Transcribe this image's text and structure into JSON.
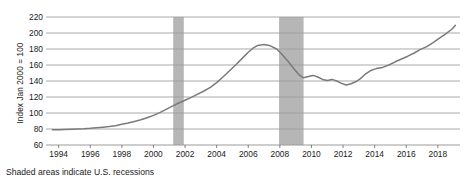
{
  "chart_data": {
    "type": "line",
    "title": "",
    "subtitle": "",
    "xlabel": "",
    "ylabel": "Index Jan 2000 = 100",
    "xlim": [
      1993.2,
      2019.4
    ],
    "ylim": [
      60,
      220
    ],
    "grid": true,
    "legend": null,
    "y_ticks": [
      60,
      80,
      100,
      120,
      140,
      160,
      180,
      200,
      220
    ],
    "x_ticks": [
      1994,
      1996,
      1998,
      2000,
      2002,
      2004,
      2006,
      2008,
      2010,
      2012,
      2014,
      2016,
      2018
    ],
    "colors": {
      "line": "#7a7a7a",
      "grid": "#9b9b9b",
      "recession_band": "#b6b6b6",
      "text": "#1a1a1a",
      "background": "#ffffff"
    },
    "annotations": [
      {
        "name": "recession-note",
        "text": "Shaded areas indicate U.S. recessions"
      }
    ],
    "shaded_regions": [
      {
        "name": "recession-2001",
        "x_start": 2001.25,
        "x_end": 2001.92
      },
      {
        "name": "recession-2008",
        "x_start": 2007.95,
        "x_end": 2009.5
      }
    ],
    "series": [
      {
        "name": "Home price index",
        "x": [
          1993.6,
          1994.0,
          1994.4,
          1994.8,
          1995.2,
          1995.6,
          1996.0,
          1996.4,
          1996.8,
          1997.2,
          1997.6,
          1998.0,
          1998.4,
          1998.8,
          1999.2,
          1999.6,
          2000.0,
          2000.4,
          2000.8,
          2001.2,
          2001.6,
          2002.0,
          2002.4,
          2002.8,
          2003.2,
          2003.6,
          2004.0,
          2004.4,
          2004.8,
          2005.2,
          2005.6,
          2006.0,
          2006.3,
          2006.6,
          2007.0,
          2007.4,
          2007.8,
          2008.1,
          2008.5,
          2008.9,
          2009.2,
          2009.5,
          2009.8,
          2010.1,
          2010.4,
          2010.7,
          2011.0,
          2011.3,
          2011.6,
          2011.9,
          2012.2,
          2012.5,
          2012.8,
          2013.1,
          2013.4,
          2013.8,
          2014.1,
          2014.5,
          2014.9,
          2015.3,
          2015.7,
          2016.1,
          2016.5,
          2016.9,
          2017.3,
          2017.7,
          2018.1,
          2018.5,
          2018.9,
          2019.1
        ],
        "y": [
          79.0,
          79.2,
          79.5,
          79.8,
          80.0,
          80.3,
          80.8,
          81.5,
          82.3,
          83.0,
          84.2,
          85.8,
          87.5,
          89.5,
          91.5,
          94.0,
          97.0,
          100.5,
          104.5,
          108.5,
          112.5,
          116.0,
          119.5,
          123.5,
          127.5,
          132.0,
          138.0,
          145.0,
          152.5,
          160.0,
          168.0,
          176.0,
          181.0,
          184.5,
          185.5,
          184.0,
          180.0,
          174.0,
          165.0,
          155.0,
          148.0,
          144.0,
          145.5,
          147.0,
          145.0,
          142.0,
          140.5,
          142.0,
          140.0,
          137.0,
          135.0,
          136.5,
          139.0,
          143.0,
          148.5,
          153.5,
          155.5,
          157.0,
          160.0,
          164.0,
          167.5,
          171.0,
          175.0,
          179.5,
          183.0,
          188.0,
          193.5,
          199.0,
          205.0,
          209.5
        ]
      }
    ]
  },
  "axis": {
    "ylabel": "Index Jan 2000 = 100"
  },
  "caption": {
    "text": "Shaded areas indicate U.S. recessions"
  }
}
